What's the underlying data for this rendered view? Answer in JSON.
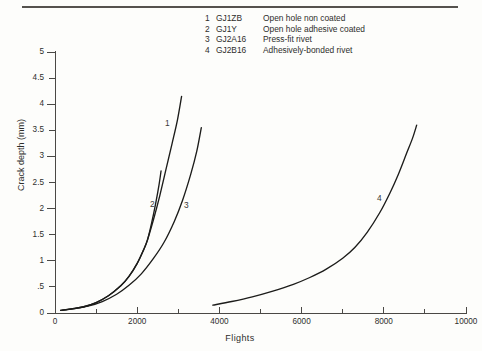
{
  "figure": {
    "background_color": "#fdfdfb",
    "ink_color": "#1c1c1a"
  },
  "legend": {
    "entries": [
      {
        "number": "1",
        "code": "GJ1ZB",
        "description": "Open hole non coated"
      },
      {
        "number": "2",
        "code": "GJ1Y",
        "description": "Open hole adhesive coated"
      },
      {
        "number": "3",
        "code": "GJ2A16",
        "description": "Press-fit rivet"
      },
      {
        "number": "4",
        "code": "GJ2B16",
        "description": "Adhesively-bonded rivet"
      }
    ]
  },
  "chart_data": {
    "type": "line",
    "title": "",
    "xlabel": "Flights",
    "ylabel": "Crack depth (mm)",
    "xlim": [
      0,
      10000
    ],
    "ylim": [
      0,
      5
    ],
    "grid": false,
    "legend_position": "top-center",
    "xticks": [
      0,
      2000,
      4000,
      6000,
      8000,
      10000
    ],
    "xticklabels": [
      "0",
      "2000",
      "4000",
      "6000",
      "8000",
      "10000"
    ],
    "xminor_ticks": [
      1000,
      3000,
      5000,
      7000,
      9000
    ],
    "yticks": [
      0,
      0.5,
      1,
      1.5,
      2,
      2.5,
      3,
      3.5,
      4,
      4.5,
      5
    ],
    "yticklabels": [
      "0",
      ".5",
      "1",
      "1.5",
      "2",
      "2.5",
      "3",
      "3.5",
      "4",
      "4.5",
      "5"
    ],
    "series": [
      {
        "name": "1",
        "label": "GJ1ZB — Open hole non coated",
        "annotation": "1",
        "points": [
          [
            140,
            0.05
          ],
          [
            400,
            0.08
          ],
          [
            700,
            0.12
          ],
          [
            1000,
            0.2
          ],
          [
            1300,
            0.33
          ],
          [
            1600,
            0.52
          ],
          [
            1800,
            0.7
          ],
          [
            2000,
            0.95
          ],
          [
            2150,
            1.2
          ],
          [
            2250,
            1.4
          ],
          [
            2400,
            1.8
          ],
          [
            2550,
            2.25
          ],
          [
            2700,
            2.75
          ],
          [
            2850,
            3.25
          ],
          [
            2980,
            3.7
          ],
          [
            3080,
            4.15
          ]
        ]
      },
      {
        "name": "2",
        "label": "GJ1Y — Open hole adhesive coated",
        "annotation": "2",
        "points": [
          [
            140,
            0.05
          ],
          [
            400,
            0.08
          ],
          [
            700,
            0.12
          ],
          [
            1000,
            0.2
          ],
          [
            1300,
            0.33
          ],
          [
            1600,
            0.52
          ],
          [
            1800,
            0.7
          ],
          [
            2000,
            0.95
          ],
          [
            2150,
            1.2
          ],
          [
            2250,
            1.4
          ],
          [
            2350,
            1.72
          ],
          [
            2450,
            2.1
          ],
          [
            2530,
            2.45
          ],
          [
            2580,
            2.72
          ]
        ]
      },
      {
        "name": "3",
        "label": "GJ2A16 — Press-fit rivet",
        "annotation": "3",
        "points": [
          [
            140,
            0.05
          ],
          [
            450,
            0.08
          ],
          [
            800,
            0.13
          ],
          [
            1150,
            0.22
          ],
          [
            1500,
            0.36
          ],
          [
            1800,
            0.53
          ],
          [
            2100,
            0.75
          ],
          [
            2400,
            1.05
          ],
          [
            2650,
            1.35
          ],
          [
            2900,
            1.75
          ],
          [
            3100,
            2.15
          ],
          [
            3300,
            2.65
          ],
          [
            3450,
            3.1
          ],
          [
            3560,
            3.55
          ]
        ]
      },
      {
        "name": "4",
        "label": "GJ2B16 — Adhesively-bonded rivet",
        "annotation": "4",
        "points": [
          [
            3840,
            0.15
          ],
          [
            4300,
            0.22
          ],
          [
            4800,
            0.31
          ],
          [
            5300,
            0.42
          ],
          [
            5800,
            0.55
          ],
          [
            6200,
            0.68
          ],
          [
            6600,
            0.84
          ],
          [
            7000,
            1.05
          ],
          [
            7300,
            1.26
          ],
          [
            7600,
            1.55
          ],
          [
            7900,
            1.92
          ],
          [
            8150,
            2.3
          ],
          [
            8350,
            2.65
          ],
          [
            8550,
            3.05
          ],
          [
            8700,
            3.35
          ],
          [
            8800,
            3.6
          ]
        ]
      }
    ]
  }
}
